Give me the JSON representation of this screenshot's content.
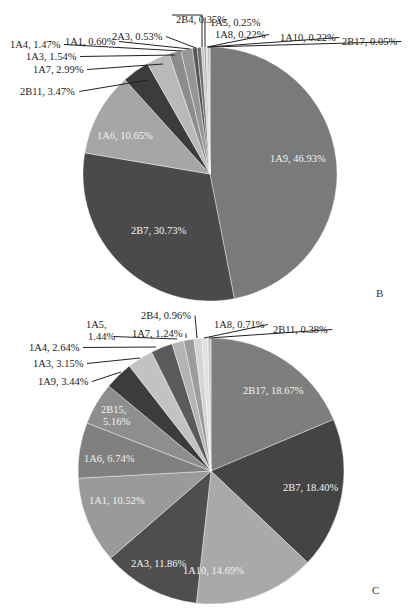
{
  "chart_data": [
    {
      "type": "pie",
      "panel_label": "B",
      "center": [
        210,
        174
      ],
      "radius": 127,
      "slices": [
        {
          "name": "1A9",
          "value": 46.93,
          "label": "1A9, 46.93%",
          "color": "#7a7a7a",
          "inside": true,
          "lx": 270,
          "ly": 162
        },
        {
          "name": "2B7",
          "value": 30.73,
          "label": "2B7, 30.73%",
          "color": "#4a4a4a",
          "inside": true,
          "lx": 131,
          "ly": 234
        },
        {
          "name": "1A6",
          "value": 10.65,
          "label": "1A6, 10.65%",
          "color": "#a6a6a6",
          "inside": true,
          "lx": 97,
          "ly": 139
        },
        {
          "name": "2B11",
          "value": 3.47,
          "label": "2B11, 3.47%",
          "color": "#3c3c3c",
          "inside": false,
          "lx": 20,
          "ly": 95,
          "ax": 148,
          "ay": 80
        },
        {
          "name": "1A7",
          "value": 2.99,
          "label": "1A7, 2.99%",
          "color": "#b9b9b9",
          "inside": false,
          "lx": 33,
          "ly": 73,
          "ax": 163,
          "ay": 64
        },
        {
          "name": "1A3",
          "value": 1.54,
          "label": "1A3, 1.54%",
          "color": "#8c8c8c",
          "inside": false,
          "lx": 26,
          "ly": 60,
          "ax": 175,
          "ay": 55
        },
        {
          "name": "1A4",
          "value": 1.47,
          "label": "1A4, 1.47%",
          "color": "#969696",
          "inside": false,
          "lx": 10,
          "ly": 48,
          "ax": 182,
          "ay": 51
        },
        {
          "name": "1A1",
          "value": 0.6,
          "label": "1A1, 0.60%",
          "color": "#555555",
          "inside": false,
          "lx": 65,
          "ly": 45,
          "ax": 190,
          "ay": 49
        },
        {
          "name": "2A3",
          "value": 0.53,
          "label": "2A3, 0.53%",
          "color": "#6e6e6e",
          "inside": false,
          "lx": 112,
          "ly": 40,
          "ax": 196,
          "ay": 48
        },
        {
          "name": "2B4",
          "value": 0.35,
          "label": "2B4, 0.35%",
          "color": "#c8c8c8",
          "inside": false,
          "lx": 176,
          "ly": 23,
          "ax": 202,
          "ay": 47
        },
        {
          "name": "1A5",
          "value": 0.25,
          "label": "1A5, 0.25%",
          "color": "#9e9e9e",
          "inside": false,
          "lx": 210,
          "ly": 26,
          "ax": 205,
          "ay": 47
        },
        {
          "name": "1A8",
          "value": 0.22,
          "label": "1A8, 0.22%",
          "color": "#d2d2d2",
          "inside": false,
          "lx": 215,
          "ly": 38,
          "ax": 207,
          "ay": 47
        },
        {
          "name": "1A10",
          "value": 0.22,
          "label": "1A10, 0.22%",
          "color": "#b0b0b0",
          "inside": false,
          "lx": 280,
          "ly": 41,
          "ax": 208,
          "ay": 47
        },
        {
          "name": "2B17",
          "value": 0.05,
          "label": "2B17, 0.05%",
          "color": "#888888",
          "inside": false,
          "lx": 342,
          "ly": 45,
          "ax": 209,
          "ay": 47
        }
      ]
    },
    {
      "type": "pie",
      "panel_label": "C",
      "center": [
        211,
        471
      ],
      "radius": 133,
      "slices": [
        {
          "name": "2B17",
          "value": 18.67,
          "label": "2B17, 18.67%",
          "color": "#7e7e7e",
          "inside": true,
          "lx": 243,
          "ly": 394
        },
        {
          "name": "2B7",
          "value": 18.4,
          "label": "2B7, 18.40%",
          "color": "#444444",
          "inside": true,
          "lx": 283,
          "ly": 491
        },
        {
          "name": "1A10",
          "value": 14.69,
          "label": "1A10, 14.69%",
          "color": "#a9a9a9",
          "inside": true,
          "lx": 183,
          "ly": 574
        },
        {
          "name": "2A3",
          "value": 11.86,
          "label": "2A3, 11.86%",
          "color": "#4e4e4e",
          "inside": true,
          "lx": 131,
          "ly": 567
        },
        {
          "name": "1A1",
          "value": 10.52,
          "label": "1A1, 10.52%",
          "color": "#9a9a9a",
          "inside": true,
          "lx": 89,
          "ly": 504
        },
        {
          "name": "1A6",
          "value": 6.74,
          "label": "1A6, 6.74%",
          "color": "#808080",
          "inside": true,
          "lx": 84,
          "ly": 462
        },
        {
          "name": "2B15",
          "value": 5.16,
          "label": "2B15,|5.16%",
          "color": "#8e8e8e",
          "inside": true,
          "lx": 101,
          "ly": 413
        },
        {
          "name": "1A9",
          "value": 3.44,
          "label": "1A9, 3.44%",
          "color": "#3c3c3c",
          "inside": false,
          "lx": 38,
          "ly": 385,
          "ax": 121,
          "ay": 372
        },
        {
          "name": "1A3",
          "value": 3.15,
          "label": "1A3, 3.15%",
          "color": "#c2c2c2",
          "inside": false,
          "lx": 33,
          "ly": 367,
          "ax": 140,
          "ay": 358
        },
        {
          "name": "1A4",
          "value": 2.64,
          "label": "1A4, 2.64%",
          "color": "#5a5a5a",
          "inside": false,
          "lx": 29,
          "ly": 351,
          "ax": 156,
          "ay": 347
        },
        {
          "name": "1A5",
          "value": 1.44,
          "label": "1A5,|1.44%",
          "color": "#b4b4b4",
          "inside": false,
          "lx": 86,
          "ly": 328,
          "ax": 177,
          "ay": 339
        },
        {
          "name": "1A7",
          "value": 1.24,
          "label": "1A7, 1.24%",
          "color": "#9c9c9c",
          "inside": false,
          "lx": 132,
          "ly": 337,
          "ax": 186,
          "ay": 338
        },
        {
          "name": "2B4",
          "value": 0.96,
          "label": "2B4, 0.96%",
          "color": "#d4d4d4",
          "inside": false,
          "lx": 141,
          "ly": 319,
          "ax": 197,
          "ay": 338
        },
        {
          "name": "1A8",
          "value": 0.71,
          "label": "1A8, 0.71%",
          "color": "#e0e0e0",
          "inside": false,
          "lx": 214,
          "ly": 328,
          "ax": 204,
          "ay": 338
        },
        {
          "name": "2B11",
          "value": 0.38,
          "label": "2B11, 0.38%",
          "color": "#cacaca",
          "inside": false,
          "lx": 273,
          "ly": 333,
          "ax": 209,
          "ay": 338
        }
      ]
    }
  ]
}
